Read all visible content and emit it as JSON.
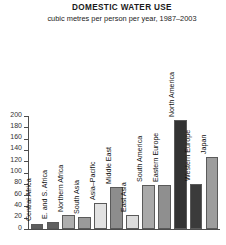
{
  "header": {
    "title": "DOMESTIC WATER USE",
    "subtitle": "cubic metres per person per year, 1987–2003"
  },
  "axis": {
    "y_ticks": [
      "0",
      "20",
      "40",
      "60",
      "80",
      "100",
      "120",
      "140",
      "160",
      "180",
      "200"
    ]
  },
  "chart_data": {
    "type": "bar",
    "title": "DOMESTIC WATER USE",
    "subtitle": "cubic metres per person per year, 1987–2003",
    "xlabel": "",
    "ylabel": "",
    "ylim": [
      0,
      200
    ],
    "ytick_step": 20,
    "grid": false,
    "legend": "none",
    "categories": [
      "Central Africa",
      "E. and S. Africa",
      "Northern Africa",
      "South Asia",
      "Asia–Pacific",
      "Middle East",
      "East Asia",
      "South America",
      "Eastern Europe",
      "North America",
      "Western Europe",
      "Japan"
    ],
    "values": [
      9,
      13,
      25,
      22,
      46,
      74,
      25,
      78,
      78,
      193,
      79,
      128
    ],
    "bar_colors": [
      "#5e5e5e",
      "#606060",
      "#aeaeae",
      "#9a9a9a",
      "#e2e2e2",
      "#8d8d8d",
      "#dcdcdc",
      "#a9a9a9",
      "#8f8f8f",
      "#333333",
      "#3b3b3b",
      "#9d9d9d"
    ]
  }
}
